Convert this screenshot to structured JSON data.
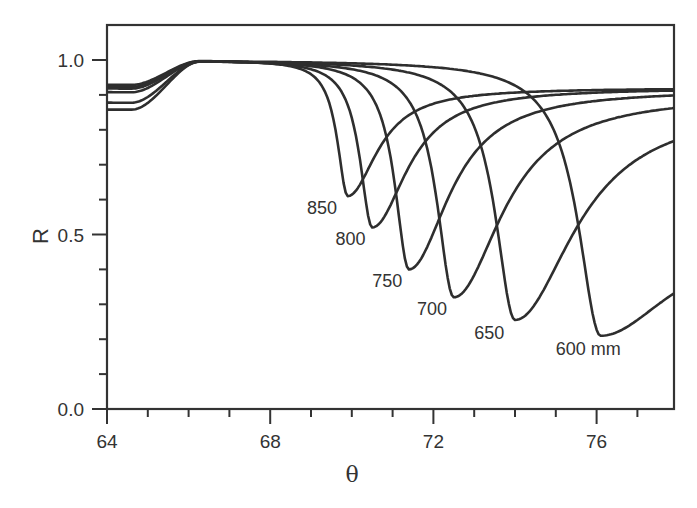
{
  "chart_data": {
    "type": "line",
    "title": "",
    "xlabel": "θ",
    "ylabel": "R",
    "xlim": [
      64,
      77.9
    ],
    "ylim": [
      0.0,
      1.1
    ],
    "grid": false,
    "legend": "inline labels at curve minima",
    "x_ticks": [
      64,
      68,
      72,
      76
    ],
    "x_minor_step": 1,
    "y_ticks": [
      0.0,
      0.5,
      1.0
    ],
    "y_tick_labels": [
      "0.0",
      "0.5",
      "1.0"
    ],
    "y_minor_step": 0.1,
    "series": [
      {
        "name": "850",
        "label": "850",
        "theta_min": 69.9,
        "R_min": 0.61,
        "start_R": 0.93,
        "end_R": 0.92,
        "w_left": 0.55,
        "w_right": 1.1,
        "label_pos": [
          68.9,
          0.56
        ],
        "points": [
          [
            64,
            0.93
          ],
          [
            66,
            0.98
          ],
          [
            67.5,
            1.0
          ],
          [
            68.5,
            0.97
          ],
          [
            69.2,
            0.85
          ],
          [
            69.9,
            0.61
          ],
          [
            70.5,
            0.72
          ],
          [
            71.5,
            0.83
          ],
          [
            73,
            0.89
          ],
          [
            75,
            0.91
          ],
          [
            77.9,
            0.92
          ]
        ]
      },
      {
        "name": "800",
        "label": "800",
        "theta_min": 70.5,
        "R_min": 0.52,
        "start_R": 0.925,
        "end_R": 0.92,
        "w_left": 0.65,
        "w_right": 1.3,
        "label_pos": [
          69.6,
          0.47
        ],
        "points": [
          [
            64,
            0.925
          ],
          [
            66,
            0.98
          ],
          [
            67.5,
            1.0
          ],
          [
            69,
            0.96
          ],
          [
            69.8,
            0.82
          ],
          [
            70.5,
            0.52
          ],
          [
            71.2,
            0.66
          ],
          [
            72.5,
            0.81
          ],
          [
            74,
            0.88
          ],
          [
            76,
            0.91
          ],
          [
            77.9,
            0.92
          ]
        ]
      },
      {
        "name": "750",
        "label": "750",
        "theta_min": 71.4,
        "R_min": 0.4,
        "start_R": 0.92,
        "end_R": 0.915,
        "w_left": 0.75,
        "w_right": 1.5,
        "label_pos": [
          70.5,
          0.35
        ],
        "points": [
          [
            64,
            0.92
          ],
          [
            66,
            0.98
          ],
          [
            67.5,
            1.0
          ],
          [
            69.5,
            0.96
          ],
          [
            70.6,
            0.78
          ],
          [
            71.4,
            0.4
          ],
          [
            72.2,
            0.55
          ],
          [
            73.5,
            0.75
          ],
          [
            75,
            0.85
          ],
          [
            77,
            0.9
          ],
          [
            77.9,
            0.915
          ]
        ]
      },
      {
        "name": "700",
        "label": "700",
        "theta_min": 72.5,
        "R_min": 0.32,
        "start_R": 0.91,
        "end_R": 0.9,
        "w_left": 0.9,
        "w_right": 1.8,
        "label_pos": [
          71.6,
          0.27
        ],
        "points": [
          [
            64,
            0.91
          ],
          [
            66,
            0.98
          ],
          [
            67.5,
            1.0
          ],
          [
            70,
            0.96
          ],
          [
            71.5,
            0.74
          ],
          [
            72.5,
            0.32
          ],
          [
            73.5,
            0.5
          ],
          [
            75,
            0.72
          ],
          [
            76.5,
            0.83
          ],
          [
            77.9,
            0.9
          ]
        ]
      },
      {
        "name": "650",
        "label": "650",
        "theta_min": 74.0,
        "R_min": 0.255,
        "start_R": 0.88,
        "end_R": 0.87,
        "w_left": 1.05,
        "w_right": 2.2,
        "label_pos": [
          73.0,
          0.2
        ],
        "points": [
          [
            64,
            0.88
          ],
          [
            66,
            0.98
          ],
          [
            67.5,
            1.0
          ],
          [
            70.5,
            0.96
          ],
          [
            72.5,
            0.72
          ],
          [
            74.0,
            0.255
          ],
          [
            75,
            0.42
          ],
          [
            76.5,
            0.66
          ],
          [
            77.9,
            0.79
          ]
        ]
      },
      {
        "name": "600",
        "label": "600 mm",
        "theta_min": 76.1,
        "R_min": 0.21,
        "start_R": 0.86,
        "end_R": 0.49,
        "w_left": 1.2,
        "w_right": 2.6,
        "label_pos": [
          75.0,
          0.155
        ],
        "points": [
          [
            64,
            0.86
          ],
          [
            66,
            0.98
          ],
          [
            67.5,
            1.0
          ],
          [
            71,
            0.96
          ],
          [
            73.5,
            0.75
          ],
          [
            76.1,
            0.21
          ],
          [
            77,
            0.32
          ],
          [
            77.9,
            0.49
          ]
        ]
      }
    ]
  },
  "axes": {
    "x_title": "θ",
    "y_title": "R"
  }
}
